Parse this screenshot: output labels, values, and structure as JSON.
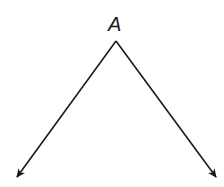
{
  "diagram": {
    "type": "angle",
    "vertex": {
      "label": "A",
      "x": 116,
      "y": 41,
      "label_x": 108,
      "label_y": 14
    },
    "rays": [
      {
        "name": "left-ray",
        "x1": 116,
        "y1": 41,
        "x2": 17,
        "y2": 177
      },
      {
        "name": "right-ray",
        "x1": 116,
        "y1": 41,
        "x2": 216,
        "y2": 177
      }
    ],
    "stroke_color": "#1a1a1a",
    "background": "#ffffff"
  }
}
